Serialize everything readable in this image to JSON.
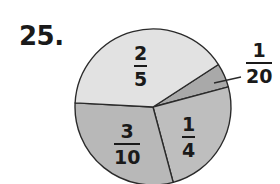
{
  "problem": {
    "number": "25."
  },
  "chart_data": {
    "type": "pie",
    "title": "",
    "center": [
      153,
      107
    ],
    "radius": 78,
    "start_angle_deg": -33,
    "direction": "clockwise",
    "slices": [
      {
        "label": "1/20",
        "numerator": "1",
        "denominator": "20",
        "value": 0.05,
        "color": "#a9a9a9",
        "label_position": "outside-right"
      },
      {
        "label": "1/4",
        "numerator": "1",
        "denominator": "4",
        "value": 0.25,
        "color": "#bebebe",
        "label_position": "inside"
      },
      {
        "label": "3/10",
        "numerator": "3",
        "denominator": "10",
        "value": 0.3,
        "color": "#b8b8b8",
        "label_position": "inside"
      },
      {
        "label": "2/5",
        "numerator": "2",
        "denominator": "5",
        "value": 0.4,
        "color": "#e2e2e2",
        "label_position": "inside"
      }
    ],
    "stroke_color": "#2a2a2a",
    "legend": "none"
  },
  "labels": {
    "twentieth": {
      "num": "1",
      "den": "20"
    },
    "quarter": {
      "num": "1",
      "den": "4"
    },
    "tenths": {
      "num": "3",
      "den": "10"
    },
    "fifths": {
      "num": "2",
      "den": "5"
    }
  }
}
